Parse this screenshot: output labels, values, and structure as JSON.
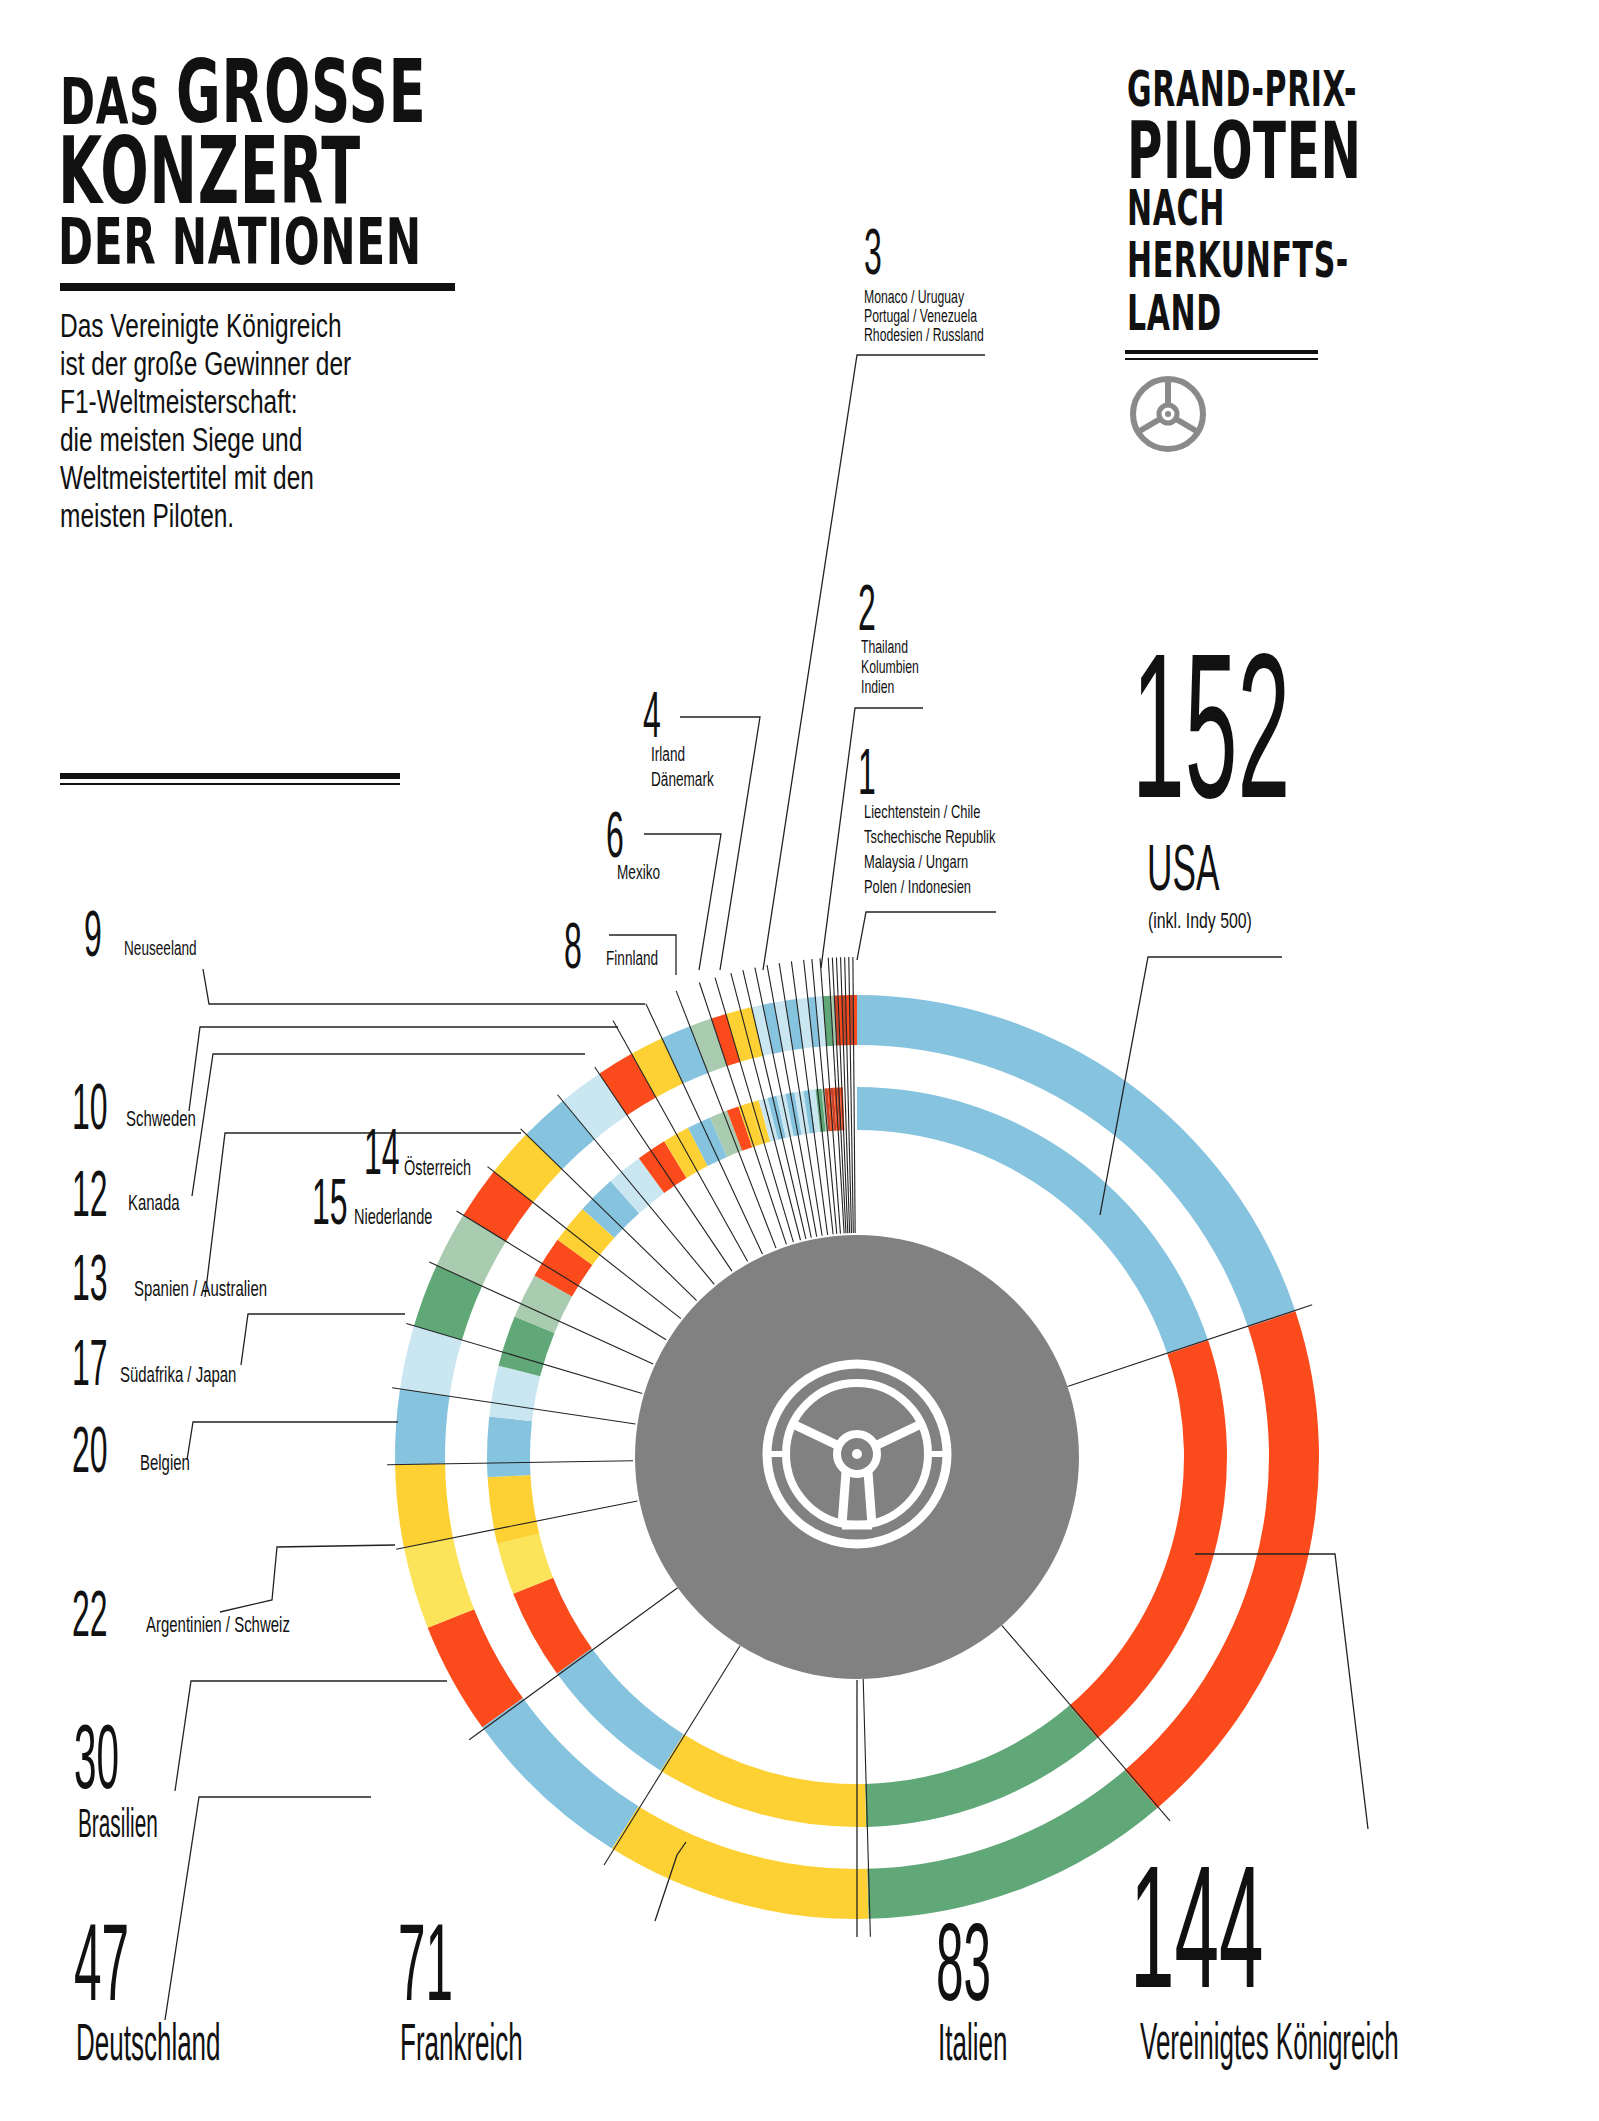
{
  "left_title": {
    "line1_small": "DAS",
    "line1_big": "GROSSE",
    "line2": "KONZERT",
    "line3": "DER NATIONEN"
  },
  "intro_text": [
    "Das Vereinigte Königreich",
    "ist der große Gewinner der",
    "F1-Weltmeisterschaft:",
    "die meisten Siege und",
    "Weltmeistertitel mit den",
    "meisten Piloten."
  ],
  "right_title": {
    "line1": "GRAND-PRIX-",
    "line2": "PILOTEN",
    "line3": "NACH",
    "line4": "HERKUNFTS-",
    "line5": "LAND",
    "icon": "steering-wheel-icon"
  },
  "colors": {
    "blue": "#86c3df",
    "light_blue": "#c9e6f1",
    "red": "#fb4a1c",
    "dark_red": "#c9452a",
    "yellow": "#fdd033",
    "light_yellow": "#fbe35a",
    "green": "#61a878",
    "light_green": "#a9cbb0",
    "gray": "#818181",
    "ink": "#111111"
  },
  "chart_data": {
    "type": "pie",
    "subtitle": "Das große Konzert der Nationen",
    "unit": "Piloten",
    "categories": [
      "USA",
      "Vereinigtes Königreich",
      "Italien",
      "Frankreich",
      "Deutschland",
      "Brasilien",
      "Argentinien",
      "Schweiz",
      "Belgien",
      "Südafrika",
      "Japan",
      "Niederlande",
      "Österreich",
      "Spanien",
      "Australien",
      "Kanada",
      "Schweden",
      "Neuseeland",
      "Finnland",
      "Mexiko",
      "Irland",
      "Dänemark",
      "Monaco",
      "Uruguay",
      "Portugal",
      "Venezuela",
      "Rhodesien",
      "Russland",
      "Thailand",
      "Kolumbien",
      "Indien",
      "Liechtenstein",
      "Chile",
      "Tschechische Republik",
      "Malaysia",
      "Ungarn",
      "Polen",
      "Indonesien"
    ],
    "values": [
      152,
      144,
      83,
      71,
      47,
      30,
      22,
      22,
      20,
      17,
      17,
      15,
      14,
      13,
      13,
      12,
      10,
      9,
      8,
      6,
      4,
      4,
      3,
      3,
      3,
      3,
      3,
      3,
      2,
      2,
      2,
      1,
      1,
      1,
      1,
      1,
      1,
      1
    ],
    "segment_colors": [
      "blue",
      "red",
      "green",
      "yellow",
      "blue",
      "red",
      "light_yellow",
      "yellow",
      "blue",
      "light_blue",
      "green",
      "light_green",
      "red",
      "yellow",
      "blue",
      "light_blue",
      "red",
      "yellow",
      "blue",
      "light_green",
      "red",
      "yellow",
      "yellow",
      "light_blue",
      "blue",
      "light_blue",
      "blue",
      "light_blue",
      "blue",
      "light_blue",
      "green",
      "light_green",
      "dark_red",
      "red",
      "dark_red",
      "red",
      "dark_red",
      "red"
    ],
    "notes": {
      "USA": "(inkl. Indy 500)"
    },
    "rings": 2,
    "legend_position": "callout labels around chart"
  },
  "labels": {
    "usa": {
      "value": "152",
      "name": "USA",
      "note": "(inkl. Indy 500)"
    },
    "uk": {
      "value": "144",
      "name": "Vereinigtes Königreich"
    },
    "italy": {
      "value": "83",
      "name": "Italien"
    },
    "france": {
      "value": "71",
      "name": "Frankreich"
    },
    "germany": {
      "value": "47",
      "name": "Deutschland"
    },
    "brazil": {
      "value": "30",
      "name": "Brasilien"
    },
    "arg_sui": {
      "value": "22",
      "name": "Argentinien / Schweiz"
    },
    "belgium": {
      "value": "20",
      "name": "Belgien"
    },
    "rsa_jpn": {
      "value": "17",
      "name": "Südafrika / Japan"
    },
    "netherlands": {
      "value": "15",
      "name": "Niederlande"
    },
    "austria": {
      "value": "14",
      "name": "Österreich"
    },
    "esp_aus": {
      "value": "13",
      "name": "Spanien / Australien"
    },
    "canada": {
      "value": "12",
      "name": "Kanada"
    },
    "sweden": {
      "value": "10",
      "name": "Schweden"
    },
    "nz": {
      "value": "9",
      "name": "Neuseeland"
    },
    "finland": {
      "value": "8",
      "name": "Finnland"
    },
    "mexico": {
      "value": "6",
      "name": "Mexiko"
    },
    "four": {
      "value": "4",
      "lines": [
        "Irland",
        "Dänemark"
      ]
    },
    "three": {
      "value": "3",
      "lines": [
        "Monaco / Uruguay",
        "Portugal / Venezuela",
        "Rhodesien / Russland"
      ]
    },
    "two": {
      "value": "2",
      "lines": [
        "Thailand",
        "Kolumbien",
        "Indien"
      ]
    },
    "one": {
      "value": "1",
      "lines": [
        "Liechtenstein / Chile",
        "Tschechische Republik",
        "Malaysia / Ungarn",
        "Polen / Indonesien"
      ]
    }
  }
}
